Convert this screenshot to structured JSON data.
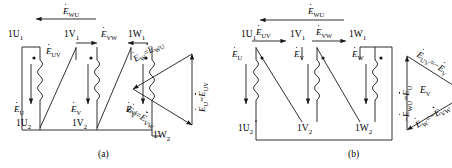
{
  "figure": {
    "panels": [
      {
        "id": "a",
        "caption": "(a)",
        "winding_diagram": {
          "top_terminals": [
            "1U",
            "1V",
            "1W"
          ],
          "top_terminal_subscript": "1",
          "bottom_terminals": [
            "1U",
            "1V",
            "1W"
          ],
          "bottom_terminal_subscript": "2",
          "top_terminal_labels": [
            "1U₁",
            "1V₁",
            "1W₁"
          ],
          "bottom_terminal_labels": [
            "1U₂",
            "1V₂",
            "1W₂"
          ],
          "phase_emf_labels": [
            "E",
            "E",
            "E"
          ],
          "phase_emf_subs": [
            "U",
            "V",
            "W"
          ],
          "line_emf_top": {
            "symbol": "E",
            "sub": "WU",
            "direction": "left"
          },
          "line_emf_mid": [
            {
              "symbol": "E",
              "sub": "UV",
              "direction": "right"
            },
            {
              "symbol": "E",
              "sub": "VW",
              "direction": "left"
            }
          ]
        },
        "phasor_diagram": {
          "type": "triangle",
          "orientation": "apex-left",
          "sides": [
            {
              "name": "upper-left",
              "text_parts": [
                "E",
                "W",
                "=",
                "E",
                "WU"
              ],
              "label": "ĖW = ĖWU"
            },
            {
              "name": "right-vertical",
              "text_parts": [
                "E",
                "U",
                "=",
                "E",
                "UV"
              ],
              "label": "ĖU = ĖUV"
            },
            {
              "name": "lower-left",
              "text_parts": [
                "E",
                "V",
                "=",
                "E",
                "VW"
              ],
              "label": "ĖV = ĖVW"
            }
          ]
        }
      },
      {
        "id": "b",
        "caption": "(b)",
        "winding_diagram": {
          "top_terminal_labels": [
            "1U₁",
            "1V₁",
            "1W₁"
          ],
          "bottom_terminal_labels": [
            "1U₂",
            "1V₂",
            "1W₂"
          ],
          "phase_emf_subs": [
            "U",
            "V",
            "W"
          ],
          "line_emf_top": {
            "symbol": "E",
            "sub": "WU",
            "direction": "left"
          },
          "line_emf_mid": [
            {
              "symbol": "E",
              "sub": "UV",
              "direction": "right"
            },
            {
              "symbol": "E",
              "sub": "VW",
              "direction": "right"
            }
          ]
        },
        "phasor_diagram": {
          "type": "triangle",
          "orientation": "apex-right",
          "center_label": {
            "symbol": "E",
            "sub": "V"
          },
          "sides": [
            {
              "name": "upper-right",
              "label": "ĖUV = −ĖV"
            },
            {
              "name": "left-vertical",
              "label": "−ĖWU = ĖU"
            },
            {
              "name": "lower-right",
              "label": "ĖW = −ĖVW"
            }
          ]
        }
      }
    ],
    "symbols": {
      "E": "E",
      "minus": "−",
      "equals": "=",
      "sub_U": "U",
      "sub_V": "V",
      "sub_W": "W",
      "sub_UV": "UV",
      "sub_VW": "VW",
      "sub_WU": "WU",
      "term_1U": "1U",
      "term_1V": "1V",
      "term_1W": "1W",
      "sub_1": "1",
      "sub_2": "2"
    },
    "colors": {
      "stroke": "#1a1a1a",
      "background": "#ffffff"
    }
  }
}
